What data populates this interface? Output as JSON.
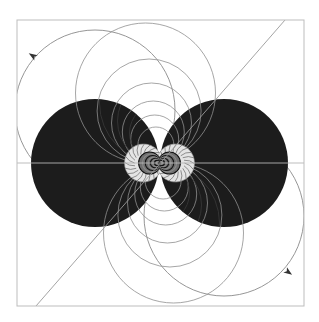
{
  "figure": {
    "type": "field-line diagram",
    "frame": {
      "x": 17,
      "y": 20,
      "width": 287,
      "height": 286,
      "stroke": "#bdbdbd"
    },
    "axis": {
      "y": 163,
      "x1": 17,
      "x2": 304,
      "stroke": "#b5b5b5"
    },
    "diagonal": {
      "x1": 36,
      "y1": 306,
      "x2": 285,
      "y2": 20,
      "stroke": "#9a9a9a"
    },
    "disks": [
      {
        "name": "left-disk",
        "cx": 95,
        "cy": 163,
        "r": 64,
        "fill": "#1c1c1c"
      },
      {
        "name": "right-disk",
        "cx": 224,
        "cy": 163,
        "r": 64,
        "fill": "#1c1c1c"
      }
    ],
    "center": {
      "x": 159.5,
      "y": 163
    },
    "outer_loops": [
      {
        "name": "upper-left-loop",
        "cx": 95,
        "cy": 117,
        "r": 80,
        "arrow": {
          "x": 33,
          "y": 56,
          "angle": -55
        }
      },
      {
        "name": "lower-right-loop",
        "cx": 224,
        "cy": 209,
        "r": 80,
        "arrow": {
          "x": 287,
          "y": 272,
          "angle": 125
        }
      }
    ],
    "colors": {
      "background": "#ffffff",
      "disk": "#1c1c1c",
      "line": "#8a8a8a",
      "light_lobe": "#e6e6e6",
      "mid_ring": "#7a7a7a"
    }
  }
}
